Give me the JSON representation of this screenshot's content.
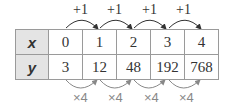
{
  "table": {
    "rows": [
      {
        "header": "x",
        "values": [
          "0",
          "1",
          "2",
          "3",
          "4"
        ]
      },
      {
        "header": "y",
        "values": [
          "3",
          "12",
          "48",
          "192",
          "768"
        ]
      }
    ]
  },
  "top_arrows": {
    "labels": [
      "+1",
      "+1",
      "+1",
      "+1"
    ]
  },
  "bottom_arrows": {
    "labels": [
      "×4",
      "×4",
      "×4",
      "×4"
    ]
  }
}
